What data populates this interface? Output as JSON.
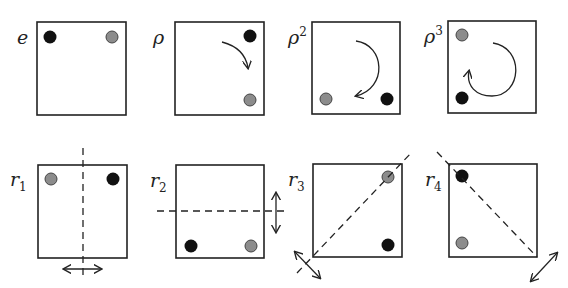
{
  "colors": {
    "black_dot": "#111111",
    "gray_dot": "#8c8c8c",
    "stroke": "#222222"
  },
  "panels": [
    {
      "id": "e",
      "label": "e",
      "sup": "",
      "sub": "",
      "black": "top-left",
      "gray": "top-right",
      "annotation": "none"
    },
    {
      "id": "rho",
      "label": "ρ",
      "sup": "",
      "sub": "",
      "black": "top-right",
      "gray": "bottom-right",
      "annotation": "clockwise quarter-turn arrow"
    },
    {
      "id": "rho2",
      "label": "ρ",
      "sup": "2",
      "sub": "",
      "black": "bottom-right",
      "gray": "bottom-left",
      "annotation": "clockwise half-turn arrow"
    },
    {
      "id": "rho3",
      "label": "ρ",
      "sup": "3",
      "sub": "",
      "black": "bottom-left",
      "gray": "top-left",
      "annotation": "clockwise three-quarter-turn arrow"
    },
    {
      "id": "r1",
      "label": "r",
      "sup": "",
      "sub": "1",
      "black": "top-right",
      "gray": "top-left",
      "annotation": "vertical reflection axis"
    },
    {
      "id": "r2",
      "label": "r",
      "sup": "",
      "sub": "2",
      "black": "bottom-left",
      "gray": "bottom-right",
      "annotation": "horizontal reflection axis"
    },
    {
      "id": "r3",
      "label": "r",
      "sup": "",
      "sub": "3",
      "black": "bottom-right",
      "gray": "top-right",
      "annotation": "diagonal reflection axis (bottom-left to top-right)"
    },
    {
      "id": "r4",
      "label": "r",
      "sup": "",
      "sub": "4",
      "black": "top-left",
      "gray": "bottom-left",
      "annotation": "anti-diagonal reflection axis (top-left to bottom-right)"
    }
  ]
}
